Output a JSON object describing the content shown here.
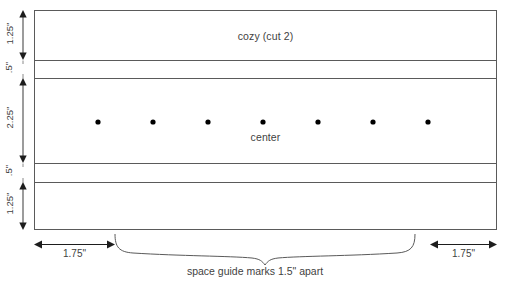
{
  "diagram": {
    "panel_label": "cozy (cut 2)",
    "center_label": "center",
    "caption": "space guide marks 1.5\" apart",
    "colors": {
      "stroke": "#5a5a5a",
      "dot": "#000000",
      "text": "#3f3f3f",
      "background": "#ffffff"
    },
    "vertical_dimensions": [
      {
        "label": "1.25\"",
        "band": "top-hem"
      },
      {
        "label": ".5\"",
        "band": "upper-fold"
      },
      {
        "label": "2.25\"",
        "band": "body-center"
      },
      {
        "label": ".5\"",
        "band": "lower-fold"
      },
      {
        "label": "1.25\"",
        "band": "bottom-hem"
      }
    ],
    "horizontal_dimensions": [
      {
        "label": "1.75\"",
        "side": "left"
      },
      {
        "label": "1.75\"",
        "side": "right"
      }
    ],
    "guide_marks": {
      "count": 7,
      "spacing_label": "1.5\"",
      "positions_x": [
        98,
        153,
        208,
        263,
        318,
        373,
        428
      ],
      "y": 122
    },
    "rect": {
      "x": 34,
      "y": 10,
      "width": 463,
      "height": 220
    },
    "divider_y": [
      60,
      78,
      163,
      182
    ]
  }
}
